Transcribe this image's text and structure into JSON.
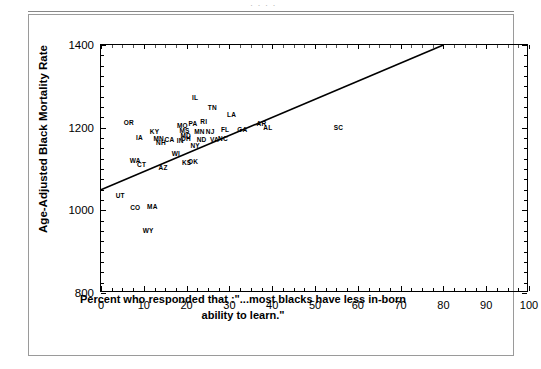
{
  "page": {
    "top_ghost_text": "· · · ·"
  },
  "chart_data": {
    "type": "scatter",
    "title": "",
    "xlabel": "Percent who responded that :\"...most blacks have less in-born ability to learn.\"",
    "xlabel_line1": "Percent who responded that :\"...most blacks have less in-born",
    "xlabel_line2": "ability to learn.\"",
    "ylabel": "Age-Adjusted Black Mortality Rate",
    "xlim": [
      0,
      100
    ],
    "ylim": [
      800,
      1400
    ],
    "xticks": [
      0,
      10,
      20,
      30,
      40,
      50,
      60,
      70,
      80,
      90,
      100
    ],
    "yticks": [
      800,
      1000,
      1200,
      1400
    ],
    "xtick_labels": [
      "0",
      "10",
      "20",
      "30",
      "40",
      "50",
      "60",
      "70",
      "80",
      "90",
      "100"
    ],
    "ytick_labels": [
      "800",
      "1000",
      "1200",
      "1400"
    ],
    "grid": false,
    "legend": "none",
    "point_marker": "state-abbreviation-text",
    "trend_line": {
      "type": "linear-fit",
      "x_start": 0,
      "y_start": 1050,
      "x_end": 80,
      "y_end": 1400,
      "slope": 4.375,
      "intercept": 1050
    },
    "points": [
      {
        "label": "OR",
        "x": 6.5,
        "y": 1213
      },
      {
        "label": "IL",
        "x": 22.0,
        "y": 1274
      },
      {
        "label": "TN",
        "x": 26.0,
        "y": 1250
      },
      {
        "label": "LA",
        "x": 30.5,
        "y": 1234
      },
      {
        "label": "MO",
        "x": 19.0,
        "y": 1207
      },
      {
        "label": "PA",
        "x": 21.5,
        "y": 1212
      },
      {
        "label": "RI",
        "x": 24.0,
        "y": 1216
      },
      {
        "label": "AR",
        "x": 37.5,
        "y": 1211
      },
      {
        "label": "AL",
        "x": 39.0,
        "y": 1202
      },
      {
        "label": "SC",
        "x": 55.5,
        "y": 1202
      },
      {
        "label": "KY",
        "x": 12.5,
        "y": 1193
      },
      {
        "label": "MS",
        "x": 19.5,
        "y": 1194
      },
      {
        "label": "MN",
        "x": 23.0,
        "y": 1191
      },
      {
        "label": "NJ",
        "x": 25.5,
        "y": 1191
      },
      {
        "label": "FL",
        "x": 29.0,
        "y": 1197
      },
      {
        "label": "GA",
        "x": 33.0,
        "y": 1196
      },
      {
        "label": "MD",
        "x": 19.8,
        "y": 1183
      },
      {
        "label": "IA",
        "x": 9.0,
        "y": 1177
      },
      {
        "label": "MN",
        "x": 13.5,
        "y": 1175
      },
      {
        "label": "CA",
        "x": 16.0,
        "y": 1172
      },
      {
        "label": "OH",
        "x": 19.8,
        "y": 1176
      },
      {
        "label": "IN",
        "x": 18.5,
        "y": 1170
      },
      {
        "label": "ND",
        "x": 23.5,
        "y": 1173
      },
      {
        "label": "VA",
        "x": 26.5,
        "y": 1173
      },
      {
        "label": "NC",
        "x": 28.5,
        "y": 1174
      },
      {
        "label": "NH",
        "x": 14.0,
        "y": 1166
      },
      {
        "label": "NY",
        "x": 22.0,
        "y": 1157
      },
      {
        "label": "WI",
        "x": 17.5,
        "y": 1139
      },
      {
        "label": "WA",
        "x": 8.0,
        "y": 1122
      },
      {
        "label": "KS",
        "x": 20.0,
        "y": 1118
      },
      {
        "label": "OK",
        "x": 21.5,
        "y": 1120
      },
      {
        "label": "CT",
        "x": 9.5,
        "y": 1113
      },
      {
        "label": "AZ",
        "x": 14.5,
        "y": 1104
      },
      {
        "label": "UT",
        "x": 4.5,
        "y": 1036
      },
      {
        "label": "CO",
        "x": 8.0,
        "y": 1009
      },
      {
        "label": "MA",
        "x": 12.0,
        "y": 1011
      },
      {
        "label": "WY",
        "x": 11.0,
        "y": 952
      }
    ]
  }
}
